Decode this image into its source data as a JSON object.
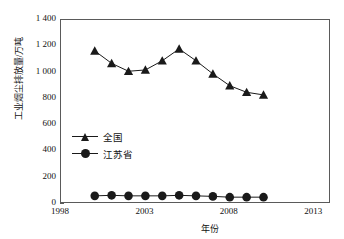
{
  "chart_data": {
    "type": "line",
    "title": "",
    "xlabel": "年份",
    "ylabel": "工业烟尘排放量/万吨",
    "x": [
      2000,
      2001,
      2002,
      2003,
      2004,
      2005,
      2006,
      2007,
      2008,
      2009,
      2010
    ],
    "xlim": [
      1998,
      2014
    ],
    "ylim": [
      0,
      1400
    ],
    "grid": false,
    "legend_position": "center-left",
    "x_ticks": [
      "1998",
      "2003",
      "2008",
      "2013"
    ],
    "x_tick_values": [
      1998,
      2003,
      2008,
      2013
    ],
    "y_ticks": [
      "0",
      "200",
      "400",
      "600",
      "800",
      "1 000",
      "1 200",
      "1 400"
    ],
    "y_tick_values": [
      0,
      200,
      400,
      600,
      800,
      1000,
      1200,
      1400
    ],
    "series": [
      {
        "name": "全国",
        "marker": "triangle",
        "color": "#1a1a1a",
        "values": [
          1165,
          1070,
          1010,
          1020,
          1090,
          1180,
          1090,
          990,
          900,
          850,
          830
        ]
      },
      {
        "name": "江苏省",
        "marker": "circle",
        "color": "#1a1a1a",
        "values": [
          62,
          66,
          62,
          62,
          62,
          66,
          62,
          58,
          52,
          52,
          52
        ]
      }
    ]
  },
  "legend": {
    "items": [
      {
        "label": "全国",
        "marker": "triangle"
      },
      {
        "label": "江苏省",
        "marker": "circle"
      }
    ]
  },
  "axes": {
    "y_title": "工业烟尘排放量/万吨",
    "x_title": "年份"
  }
}
